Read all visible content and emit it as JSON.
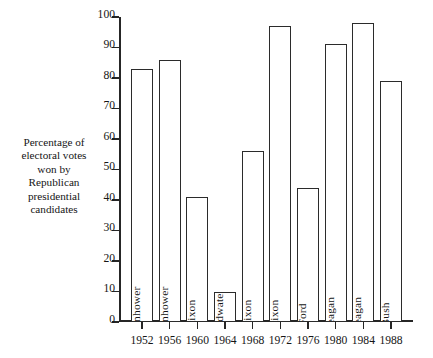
{
  "chart_data": {
    "type": "bar",
    "title": "",
    "subtitle": "",
    "xlabel": "",
    "ylabel": "Percentage of electoral votes won by Republican presidential candidates",
    "ylabel_lines": [
      "Percentage of",
      "electoral votes",
      "won by",
      "Republican",
      "presidential",
      "candidates"
    ],
    "categories": [
      "1952",
      "1956",
      "1960",
      "1964",
      "1968",
      "1972",
      "1976",
      "1980",
      "1984",
      "1988"
    ],
    "values": [
      83,
      86,
      41,
      10,
      56,
      97,
      44,
      91,
      98,
      79
    ],
    "bar_labels": [
      "Eisenhower",
      "Eisenhower",
      "Nixon",
      "Goldwater",
      "Nixon",
      "Nixon",
      "Ford",
      "Reagan",
      "Reagan",
      "Bush"
    ],
    "ylim": [
      0,
      100
    ],
    "yticks": [
      0,
      10,
      20,
      30,
      40,
      50,
      60,
      70,
      80,
      90,
      100
    ],
    "ytick_labels": [
      "0",
      "10",
      "20",
      "30",
      "40",
      "50",
      "60",
      "70",
      "80",
      "90",
      "100"
    ],
    "xtick_labels": [
      "1952",
      "1956",
      "1960",
      "1964",
      "1968",
      "1972",
      "1976",
      "1980",
      "1984",
      "1988"
    ],
    "grid": false,
    "legend": false,
    "legend_position": "none",
    "bar_style": "outlined-hollow",
    "colors": {
      "bar_fill": "#ffffff",
      "bar_stroke": "#2b2b2b",
      "axis": "#262626",
      "text": "#151515",
      "background": "#ffffff"
    }
  }
}
